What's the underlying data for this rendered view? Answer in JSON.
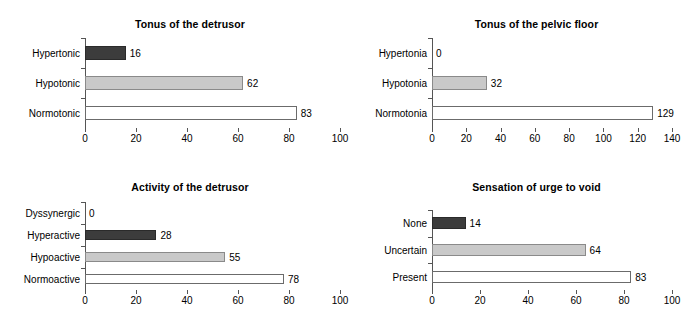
{
  "figure": {
    "background": "#ffffff",
    "panels": 4,
    "layout": "2x2"
  },
  "colors": {
    "dark_bar": "#3c3c3c",
    "light_bar": "#c9c9c9",
    "white_bar": "#ffffff",
    "axis": "#555555",
    "bar_outline": "#6b6b6b",
    "text": "#000000"
  },
  "chart_data": [
    {
      "id": "tonus-detrusor",
      "type": "bar",
      "orientation": "horizontal",
      "title": "Tonus of the detrusor",
      "xlabel": "",
      "ylabel": "",
      "categories": [
        "Normotonic",
        "Hypotonic",
        "Hypertonic"
      ],
      "values": [
        83,
        62,
        16
      ],
      "bar_styles": [
        "white",
        "light",
        "dark"
      ],
      "data_labels": [
        "83",
        "62",
        "16"
      ],
      "xlim": [
        0,
        100
      ],
      "xticks": [
        0,
        20,
        40,
        60,
        80,
        100
      ],
      "xticklabels": [
        "0",
        "20",
        "40",
        "60",
        "80",
        "100"
      ],
      "grid": false,
      "legend": false
    },
    {
      "id": "tonus-pelvic-floor",
      "type": "bar",
      "orientation": "horizontal",
      "title": "Tonus of the pelvic floor",
      "xlabel": "",
      "ylabel": "",
      "categories": [
        "Normotonia",
        "Hypotonia",
        "Hypertonia"
      ],
      "values": [
        129,
        32,
        0
      ],
      "bar_styles": [
        "white",
        "light",
        "dark"
      ],
      "data_labels": [
        "129",
        "32",
        "0"
      ],
      "xlim": [
        0,
        140
      ],
      "xticks": [
        0,
        20,
        40,
        60,
        80,
        100,
        120,
        140
      ],
      "xticklabels": [
        "0",
        "20",
        "40",
        "60",
        "80",
        "100",
        "120",
        "140"
      ],
      "grid": false,
      "legend": false
    },
    {
      "id": "activity-detrusor",
      "type": "bar",
      "orientation": "horizontal",
      "title": "Activity of the detrusor",
      "xlabel": "",
      "ylabel": "",
      "categories": [
        "Normoactive",
        "Hypoactive",
        "Hyperactive",
        "Dyssynergic"
      ],
      "values": [
        78,
        55,
        28,
        0
      ],
      "bar_styles": [
        "white",
        "light",
        "dark",
        "dark"
      ],
      "data_labels": [
        "78",
        "55",
        "28",
        "0"
      ],
      "xlim": [
        0,
        100
      ],
      "xticks": [
        0,
        20,
        40,
        60,
        80,
        100
      ],
      "xticklabels": [
        "0",
        "20",
        "40",
        "60",
        "80",
        "100"
      ],
      "grid": false,
      "legend": false
    },
    {
      "id": "sensation-urge-void",
      "type": "bar",
      "orientation": "horizontal",
      "title": "Sensation of urge to void",
      "xlabel": "",
      "ylabel": "",
      "categories": [
        "Present",
        "Uncertain",
        "None"
      ],
      "values": [
        83,
        64,
        14
      ],
      "bar_styles": [
        "white",
        "light",
        "dark"
      ],
      "data_labels": [
        "83",
        "64",
        "14"
      ],
      "xlim": [
        0,
        100
      ],
      "xticks": [
        0,
        20,
        40,
        60,
        80,
        100
      ],
      "xticklabels": [
        "0",
        "20",
        "40",
        "60",
        "80",
        "100"
      ],
      "grid": false,
      "legend": false
    }
  ]
}
